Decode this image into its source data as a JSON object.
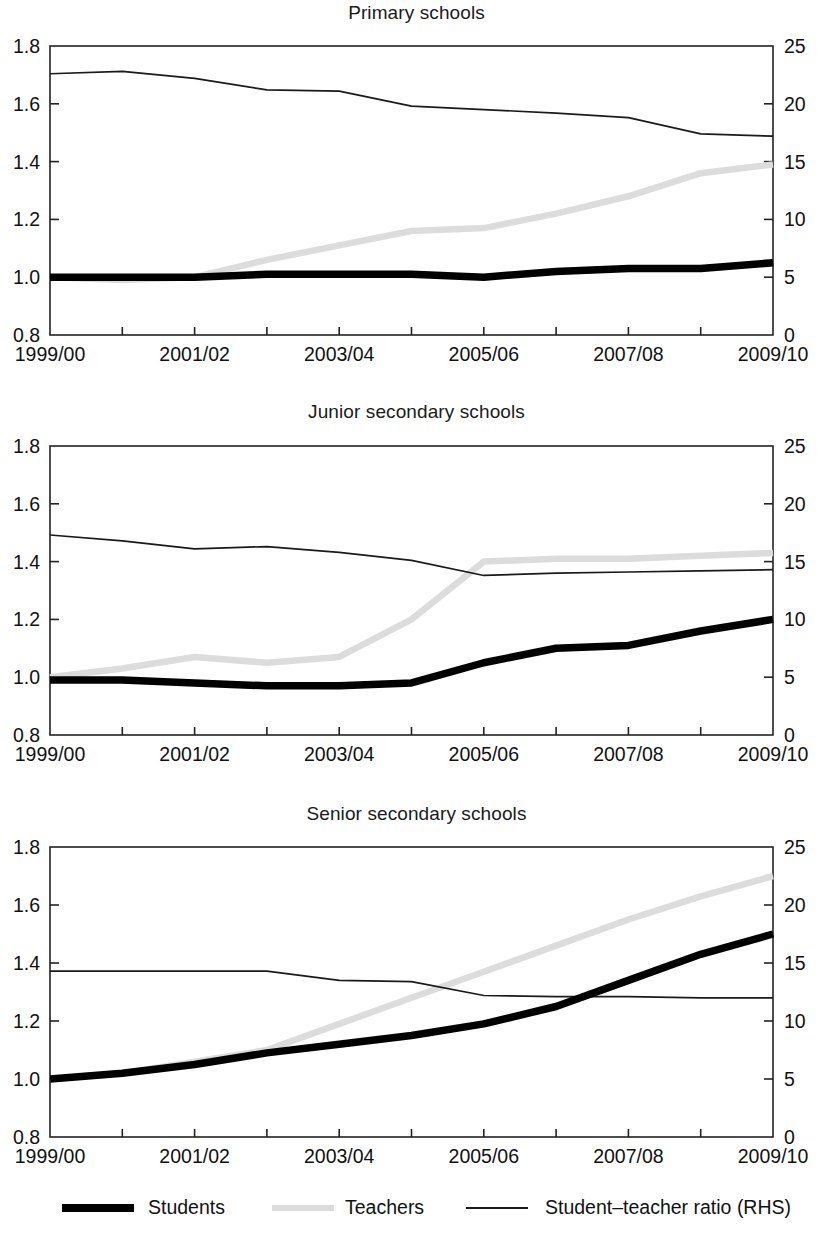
{
  "figure": {
    "background": "#ffffff",
    "axis_color": "#222222"
  },
  "legend": {
    "items": [
      {
        "label": "Students",
        "style": "thick-black",
        "color": "#000000"
      },
      {
        "label": "Teachers",
        "style": "thick-light-gray",
        "color": "#d9d9d9"
      },
      {
        "label": "Student–teacher ratio  (RHS)",
        "style": "thin-black",
        "color": "#1a1a1a"
      }
    ]
  },
  "chart_data": [
    {
      "type": "line",
      "title": "Primary schools",
      "xlabel": "",
      "ylabel": "",
      "grid": false,
      "legend_position": "bottom",
      "x": [
        "1999/00",
        "2000/01",
        "2001/02",
        "2002/03",
        "2003/04",
        "2004/05",
        "2005/06",
        "2006/07",
        "2007/08",
        "2008/09",
        "2009/10"
      ],
      "xtick_labels": [
        "1999/00",
        "",
        "2001/02",
        "",
        "2003/04",
        "",
        "2005/06",
        "",
        "2007/08",
        "",
        "2009/10"
      ],
      "ylim": [
        0.8,
        1.8
      ],
      "ytick_labels": [
        "0.8",
        "1.0",
        "1.2",
        "1.4",
        "1.6",
        "1.8"
      ],
      "ylim_right": [
        0,
        25
      ],
      "ytick_labels_right": [
        "0",
        "5",
        "10",
        "15",
        "20",
        "25"
      ],
      "series": [
        {
          "name": "Students",
          "axis": "left",
          "values": [
            1.0,
            1.0,
            1.0,
            1.01,
            1.01,
            1.01,
            1.0,
            1.02,
            1.03,
            1.03,
            1.05
          ]
        },
        {
          "name": "Teachers",
          "axis": "left",
          "values": [
            1.0,
            0.99,
            1.0,
            1.06,
            1.11,
            1.16,
            1.17,
            1.22,
            1.28,
            1.36,
            1.39
          ]
        },
        {
          "name": "Student–teacher ratio  (RHS)",
          "axis": "right",
          "values": [
            22.6,
            22.8,
            22.2,
            21.2,
            21.1,
            19.8,
            19.5,
            19.2,
            18.8,
            17.4,
            17.2
          ]
        }
      ]
    },
    {
      "type": "line",
      "title": "Junior secondary schools",
      "xlabel": "",
      "ylabel": "",
      "grid": false,
      "legend_position": "bottom",
      "x": [
        "1999/00",
        "2000/01",
        "2001/02",
        "2002/03",
        "2003/04",
        "2004/05",
        "2005/06",
        "2006/07",
        "2007/08",
        "2008/09",
        "2009/10"
      ],
      "xtick_labels": [
        "1999/00",
        "",
        "2001/02",
        "",
        "2003/04",
        "",
        "2005/06",
        "",
        "2007/08",
        "",
        "2009/10"
      ],
      "ylim": [
        0.8,
        1.8
      ],
      "ytick_labels": [
        "0.8",
        "1.0",
        "1.2",
        "1.4",
        "1.6",
        "1.8"
      ],
      "ylim_right": [
        0,
        25
      ],
      "ytick_labels_right": [
        "0",
        "5",
        "10",
        "15",
        "20",
        "25"
      ],
      "series": [
        {
          "name": "Students",
          "axis": "left",
          "values": [
            0.99,
            0.99,
            0.98,
            0.97,
            0.97,
            0.98,
            1.05,
            1.1,
            1.11,
            1.16,
            1.2
          ]
        },
        {
          "name": "Teachers",
          "axis": "left",
          "values": [
            1.0,
            1.03,
            1.07,
            1.05,
            1.07,
            1.2,
            1.4,
            1.41,
            1.41,
            1.42,
            1.43
          ]
        },
        {
          "name": "Student–teacher ratio  (RHS)",
          "axis": "right",
          "values": [
            17.3,
            16.8,
            16.1,
            16.3,
            15.8,
            15.1,
            13.8,
            14.0,
            14.1,
            14.2,
            14.3
          ]
        }
      ]
    },
    {
      "type": "line",
      "title": "Senior secondary schools",
      "xlabel": "",
      "ylabel": "",
      "grid": false,
      "legend_position": "bottom",
      "x": [
        "1999/00",
        "2000/01",
        "2001/02",
        "2002/03",
        "2003/04",
        "2004/05",
        "2005/06",
        "2006/07",
        "2007/08",
        "2008/09",
        "2009/10"
      ],
      "xtick_labels": [
        "1999/00",
        "",
        "2001/02",
        "",
        "2003/04",
        "",
        "2005/06",
        "",
        "2007/08",
        "",
        "2009/10"
      ],
      "ylim": [
        0.8,
        1.8
      ],
      "ytick_labels": [
        "0.8",
        "1.0",
        "1.2",
        "1.4",
        "1.6",
        "1.8"
      ],
      "ylim_right": [
        0,
        25
      ],
      "ytick_labels_right": [
        "0",
        "5",
        "10",
        "15",
        "20",
        "25"
      ],
      "series": [
        {
          "name": "Students",
          "axis": "left",
          "values": [
            1.0,
            1.02,
            1.05,
            1.09,
            1.12,
            1.15,
            1.19,
            1.25,
            1.34,
            1.43,
            1.5
          ]
        },
        {
          "name": "Teachers",
          "axis": "left",
          "values": [
            1.0,
            1.02,
            1.06,
            1.1,
            1.19,
            1.28,
            1.37,
            1.46,
            1.55,
            1.63,
            1.7
          ]
        },
        {
          "name": "Student–teacher ratio  (RHS)",
          "axis": "right",
          "values": [
            14.3,
            14.3,
            14.3,
            14.3,
            13.5,
            13.4,
            12.2,
            12.1,
            12.1,
            12.0,
            12.0
          ]
        }
      ]
    }
  ]
}
